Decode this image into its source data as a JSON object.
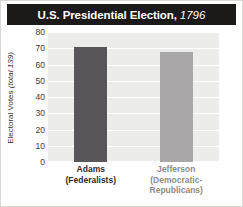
{
  "chart_data": {
    "type": "bar",
    "title": "U.S. Presidential Election,",
    "title_year": "1796",
    "categories": [
      "Adams",
      "Jefferson"
    ],
    "category_parties": [
      "(Federalists)",
      "(Democratic-Republicans)"
    ],
    "values": [
      71,
      68
    ],
    "xlabel": "",
    "ylabel": "Electoral Votes ",
    "ylabel_note": "(total 139)",
    "ylim": [
      0,
      80
    ],
    "yticks": [
      80,
      70,
      60,
      50,
      40,
      30,
      20,
      10,
      0
    ],
    "ytick_labels": [
      "80",
      "70",
      "60",
      "50",
      "40",
      "30",
      "20",
      "10",
      "0"
    ],
    "grid": true,
    "legend": false,
    "bar_colors": [
      "#58565a",
      "#a9a7a8"
    ],
    "plot_background": "#ececea",
    "gridline_color": "#ffffff",
    "title_background": "#1b1a18",
    "title_color": "#ffffff"
  }
}
